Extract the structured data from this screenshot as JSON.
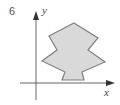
{
  "figure": {
    "number": "6",
    "x_axis_label": "x",
    "y_axis_label": "y",
    "shape": {
      "description": "grey tree-like polygon sitting on x-axis",
      "fill": "#d9d9d9",
      "stroke": "#808080",
      "points": "74,23 98,38 88,50 105,62 82,72 84,80 62,80 65,72 42,61 57,50 49,36"
    },
    "axis_color": "#666666"
  }
}
